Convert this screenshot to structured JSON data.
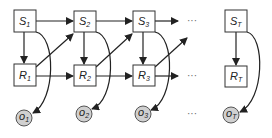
{
  "diagram": {
    "type": "dynamic-bayesian-network",
    "states": [
      {
        "id": "S1",
        "base": "S",
        "sub": "1"
      },
      {
        "id": "S2",
        "base": "S",
        "sub": "2"
      },
      {
        "id": "S3",
        "base": "S",
        "sub": "3"
      },
      {
        "id": "ST",
        "base": "S",
        "sub": "T"
      }
    ],
    "rewards": [
      {
        "id": "R1",
        "base": "R",
        "sub": "1"
      },
      {
        "id": "R2",
        "base": "R",
        "sub": "2"
      },
      {
        "id": "R3",
        "base": "R",
        "sub": "3"
      },
      {
        "id": "RT",
        "base": "R",
        "sub": "T"
      }
    ],
    "observations": [
      {
        "id": "o1",
        "base": "o",
        "sub": "1"
      },
      {
        "id": "o2",
        "base": "o",
        "sub": "2"
      },
      {
        "id": "o3",
        "base": "o",
        "sub": "3"
      },
      {
        "id": "oT",
        "base": "o",
        "sub": "T"
      }
    ],
    "ellipsis": "···",
    "edges": [
      [
        "S1",
        "S2"
      ],
      [
        "S2",
        "S3"
      ],
      [
        "S3",
        "..."
      ],
      [
        "S1",
        "R1"
      ],
      [
        "S2",
        "R2"
      ],
      [
        "S3",
        "R3"
      ],
      [
        "ST",
        "RT"
      ],
      [
        "R1",
        "S2"
      ],
      [
        "R2",
        "S3"
      ],
      [
        "R3",
        "..."
      ],
      [
        "R1",
        "R2"
      ],
      [
        "R2",
        "R3"
      ],
      [
        "R3",
        "..."
      ],
      [
        "S1",
        "o1"
      ],
      [
        "S2",
        "o2"
      ],
      [
        "S3",
        "o3"
      ],
      [
        "ST",
        "oT"
      ]
    ],
    "colors": {
      "box_stroke": "#333333",
      "observation_fill": "#d0d0d0",
      "edge": "#222222"
    }
  }
}
